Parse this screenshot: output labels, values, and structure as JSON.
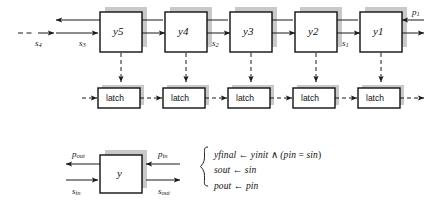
{
  "figure": {
    "colors": {
      "line": "#1b1b1b",
      "box_fill": "#ffffff",
      "box_border": "#111111",
      "shadow": "#c9c9c9",
      "text": "#141414",
      "background": "#ffffff"
    },
    "top_row": {
      "cells": [
        {
          "label": "y",
          "sub": "5"
        },
        {
          "label": "y",
          "sub": "4"
        },
        {
          "label": "y",
          "sub": "3"
        },
        {
          "label": "y",
          "sub": "2"
        },
        {
          "label": "y",
          "sub": "1"
        }
      ],
      "signal_labels": [
        {
          "name": "s",
          "sub": "4"
        },
        {
          "name": "s",
          "sub": "3"
        },
        {
          "name": "s",
          "sub": "2"
        },
        {
          "name": "s",
          "sub": "1"
        },
        {
          "name": "p",
          "sub": "1"
        }
      ]
    },
    "latch_row": {
      "label": "latch",
      "count": 5
    },
    "cell_detail": {
      "box_label": "y",
      "ports": [
        {
          "name": "p",
          "sub": "out"
        },
        {
          "name": "p",
          "sub": "in"
        },
        {
          "name": "s",
          "sub": "in"
        },
        {
          "name": "s",
          "sub": "out"
        }
      ]
    },
    "equations": [
      {
        "lhs": "y",
        "lhs_sub": "final",
        "arrow": "←",
        "rhs_pre": "y",
        "rhs_pre_sub": "init",
        "conj": "∧",
        "rhs_post": "(p",
        "rhs_post_sub": "in",
        "eq": "=",
        "rhs_tail": "s",
        "rhs_tail_sub": "in",
        "close": ")"
      },
      {
        "lhs": "s",
        "lhs_sub": "out",
        "arrow": "←",
        "rhs_pre": "s",
        "rhs_pre_sub": "in"
      },
      {
        "lhs": "p",
        "lhs_sub": "out",
        "arrow": "←",
        "rhs_pre": "p",
        "rhs_pre_sub": "in"
      }
    ],
    "equation_text": [
      "y_final ← y_init ∧ (p_in = s_in)",
      "s_out ← s_in",
      "p_out ← p_in"
    ]
  }
}
